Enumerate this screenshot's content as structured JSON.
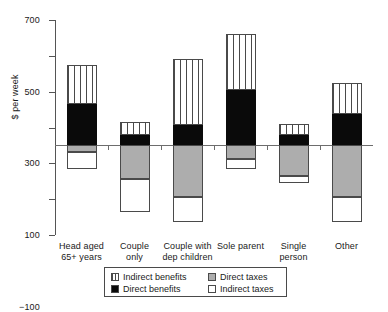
{
  "chart_data": {
    "type": "bar",
    "subtype": "stacked-diverging",
    "title": "",
    "xlabel": "",
    "ylabel": "$ per week",
    "ylim": [
      -500,
      700
    ],
    "yticks": [
      700,
      500,
      300,
      100,
      -100,
      -300,
      -500
    ],
    "ytick_labels": [
      "700",
      "500",
      "300",
      "100",
      "−100",
      "−300",
      "−500"
    ],
    "grid": false,
    "legend_position": "bottom-center",
    "categories": [
      "Head aged 65+ years",
      "Couple only",
      "Couple with dep children",
      "Sole parent",
      "Single person",
      "Other"
    ],
    "category_lines": [
      [
        "Head aged",
        "65+ years"
      ],
      [
        "Couple",
        "only"
      ],
      [
        "Couple with",
        "dep children"
      ],
      [
        "Sole parent",
        ""
      ],
      [
        "Single",
        "person"
      ],
      [
        "Other",
        ""
      ]
    ],
    "series": [
      {
        "name": "Indirect benefits",
        "key": "indirect-benefits",
        "sign": "positive",
        "values": [
          220,
          70,
          370,
          310,
          60,
          175
        ]
      },
      {
        "name": "Direct benefits",
        "key": "direct-benefits",
        "sign": "positive",
        "values": [
          230,
          60,
          115,
          310,
          60,
          175
        ]
      },
      {
        "name": "Indirect taxes",
        "key": "indirect-taxes",
        "sign": "negative",
        "values": [
          -95,
          -185,
          -135,
          -55,
          -40,
          -140
        ]
      },
      {
        "name": "Direct taxes",
        "key": "direct-taxes",
        "sign": "negative",
        "values": [
          -35,
          -185,
          -290,
          -75,
          -170,
          -290
        ]
      }
    ],
    "bar_totals_positive": [
      450,
      130,
      485,
      620,
      120,
      350
    ],
    "bar_totals_negative": [
      -130,
      -370,
      -425,
      -130,
      -210,
      -430
    ],
    "colors": {
      "indirect_benefits": "#ffffff",
      "direct_benefits": "#0a0a0a",
      "direct_taxes": "#adadad",
      "indirect_taxes": "#ffffff",
      "outline": "#4a4a4a",
      "axis": "#555555",
      "background": "#ffffff"
    }
  },
  "legend": {
    "items": [
      {
        "label": "Indirect benefits",
        "key": "indirect-benefits"
      },
      {
        "label": "Direct taxes",
        "key": "direct-taxes"
      },
      {
        "label": "Direct benefits",
        "key": "direct-benefits"
      },
      {
        "label": "Indirect taxes",
        "key": "indirect-taxes"
      }
    ]
  }
}
